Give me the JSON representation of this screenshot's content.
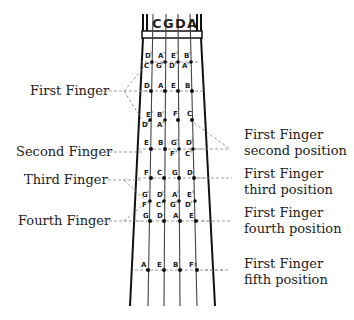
{
  "diagram": {
    "strings": [
      "C",
      "G",
      "D",
      "A"
    ],
    "left_labels": [
      {
        "text": "First Finger",
        "y": 91
      },
      {
        "text": "Second Finger",
        "y": 152
      },
      {
        "text": "Third Finger",
        "y": 180
      },
      {
        "text": "Fourth Finger",
        "y": 221
      }
    ],
    "right_labels": [
      {
        "line1": "First Finger",
        "line2": "second position",
        "y": 138
      },
      {
        "line1": "First Finger",
        "line2": "third position",
        "y": 177
      },
      {
        "line1": "First Finger",
        "line2": "fourth position",
        "y": 215
      },
      {
        "line1": "First Finger",
        "line2": "fifth position",
        "y": 265
      }
    ],
    "rows": [
      {
        "name": "chromatic-1",
        "y": 62,
        "notes": [
          {
            "upper": "D",
            "upper_acc": "♭",
            "lower": "C",
            "lower_acc": "♯"
          },
          {
            "upper": "A",
            "upper_acc": "♭",
            "lower": "G",
            "lower_acc": "♯"
          },
          {
            "upper": "E",
            "upper_acc": "♭",
            "lower": "D",
            "lower_acc": "♯"
          },
          {
            "upper": "B",
            "upper_acc": "♭",
            "lower": "A",
            "lower_acc": "♯"
          }
        ]
      },
      {
        "name": "first-finger",
        "y": 91,
        "notes": [
          "D",
          "A",
          "E",
          "B"
        ]
      },
      {
        "name": "chromatic-2",
        "y": 120,
        "notes": [
          {
            "upper": "E",
            "upper_acc": "♭",
            "lower": "D",
            "lower_acc": "♯"
          },
          {
            "upper": "B",
            "upper_acc": "♭",
            "lower": "A",
            "lower_acc": "♯"
          },
          {
            "single": "F"
          },
          {
            "single": "C"
          }
        ]
      },
      {
        "name": "second-finger",
        "y": 149,
        "notes": [
          {
            "single": "E"
          },
          {
            "single": "B"
          },
          {
            "upper": "G",
            "upper_acc": "♭",
            "lower": "F",
            "lower_acc": "♯"
          },
          {
            "upper": "D",
            "upper_acc": "♭",
            "lower": "C",
            "lower_acc": "♯"
          }
        ]
      },
      {
        "name": "third-finger",
        "y": 178,
        "notes": [
          "F",
          "C",
          "G",
          "D"
        ]
      },
      {
        "name": "chromatic-3",
        "y": 201,
        "notes": [
          {
            "upper": "G",
            "upper_acc": "♭",
            "lower": "F",
            "lower_acc": "♯"
          },
          {
            "upper": "D",
            "upper_acc": "♭",
            "lower": "C",
            "lower_acc": "♯"
          },
          {
            "upper": "A",
            "upper_acc": "♭",
            "lower": "G",
            "lower_acc": "♯"
          },
          {
            "upper": "E",
            "upper_acc": "♭",
            "lower": "D",
            "lower_acc": "♯"
          }
        ]
      },
      {
        "name": "fourth-finger",
        "y": 221,
        "notes": [
          "G",
          "D",
          "A",
          "E"
        ]
      },
      {
        "name": "fifth-position",
        "y": 270,
        "notes": [
          "A",
          "E",
          "B",
          "F♯"
        ]
      }
    ]
  }
}
